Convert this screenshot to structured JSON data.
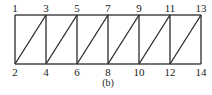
{
  "diagram": {
    "caption": "(b)",
    "nodes": [
      {
        "id": "1",
        "label": "1",
        "x": 15,
        "y": 15,
        "pos": "top"
      },
      {
        "id": "2",
        "label": "2",
        "x": 15,
        "y": 64,
        "pos": "bottom"
      },
      {
        "id": "3",
        "label": "3",
        "x": 46,
        "y": 15,
        "pos": "top"
      },
      {
        "id": "4",
        "label": "4",
        "x": 46,
        "y": 64,
        "pos": "bottom"
      },
      {
        "id": "5",
        "label": "5",
        "x": 77,
        "y": 15,
        "pos": "top"
      },
      {
        "id": "6",
        "label": "6",
        "x": 77,
        "y": 64,
        "pos": "bottom"
      },
      {
        "id": "7",
        "label": "7",
        "x": 108,
        "y": 15,
        "pos": "top"
      },
      {
        "id": "8",
        "label": "8",
        "x": 108,
        "y": 64,
        "pos": "bottom"
      },
      {
        "id": "9",
        "label": "9",
        "x": 139,
        "y": 15,
        "pos": "top"
      },
      {
        "id": "10",
        "label": "10",
        "x": 139,
        "y": 64,
        "pos": "bottom"
      },
      {
        "id": "11",
        "label": "11",
        "x": 170,
        "y": 15,
        "pos": "top"
      },
      {
        "id": "12",
        "label": "12",
        "x": 170,
        "y": 64,
        "pos": "bottom"
      },
      {
        "id": "13",
        "label": "13",
        "x": 201,
        "y": 15,
        "pos": "top"
      },
      {
        "id": "14",
        "label": "14",
        "x": 201,
        "y": 64,
        "pos": "bottom"
      }
    ],
    "edges": [
      [
        "1",
        "3"
      ],
      [
        "3",
        "5"
      ],
      [
        "5",
        "7"
      ],
      [
        "7",
        "9"
      ],
      [
        "9",
        "11"
      ],
      [
        "11",
        "13"
      ],
      [
        "2",
        "4"
      ],
      [
        "4",
        "6"
      ],
      [
        "6",
        "8"
      ],
      [
        "8",
        "10"
      ],
      [
        "10",
        "12"
      ],
      [
        "12",
        "14"
      ],
      [
        "1",
        "2"
      ],
      [
        "3",
        "4"
      ],
      [
        "5",
        "6"
      ],
      [
        "7",
        "8"
      ],
      [
        "9",
        "10"
      ],
      [
        "11",
        "12"
      ],
      [
        "13",
        "14"
      ],
      [
        "2",
        "3"
      ],
      [
        "4",
        "5"
      ],
      [
        "6",
        "7"
      ],
      [
        "8",
        "9"
      ],
      [
        "10",
        "11"
      ],
      [
        "12",
        "13"
      ]
    ]
  }
}
